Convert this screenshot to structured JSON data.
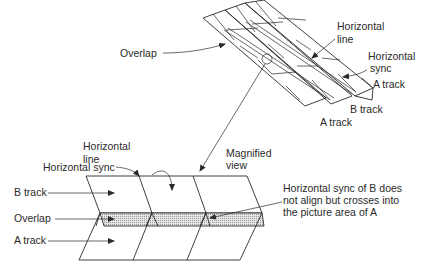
{
  "diagram": {
    "upper_tape": {
      "labels": {
        "overlap": "Overlap",
        "horizontal_line": [
          "Horizontal",
          "line"
        ],
        "horizontal_sync": [
          "Horizontal",
          "sync"
        ],
        "a_track_right": "A track",
        "b_track": "B track",
        "a_track_bottom": "A track"
      }
    },
    "magnified": {
      "labels": {
        "horizontal_line": [
          "Horizontal",
          "line"
        ],
        "magnified_view": [
          "Magnified",
          "view"
        ],
        "horizontal_sync": "Horizontal sync",
        "b_track": "B track",
        "overlap": "Overlap",
        "a_track": "A track",
        "note": [
          "Horizontal sync of B does",
          "not align but crosses into",
          "the picture area of A"
        ]
      }
    },
    "colors": {
      "line": "#2a2a2a",
      "background": "#ffffff",
      "overlap_shade": "#bdbdbd"
    }
  }
}
